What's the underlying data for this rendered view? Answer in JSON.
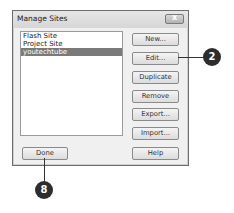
{
  "dialog": {
    "title": "Manage Sites",
    "close_glyph": "x",
    "sites": [
      {
        "label": "Flash Site",
        "selected": false
      },
      {
        "label": "Project Site",
        "selected": false
      },
      {
        "label": "youtechtube",
        "selected": true
      }
    ],
    "buttons": {
      "new": "New...",
      "edit": "Edit...",
      "duplicate": "Duplicate",
      "remove": "Remove",
      "export": "Export...",
      "import": "Import...",
      "done": "Done",
      "help": "Help"
    }
  },
  "callouts": [
    {
      "number": "2",
      "target": "Edit..."
    },
    {
      "number": "8",
      "target": "Done"
    }
  ]
}
